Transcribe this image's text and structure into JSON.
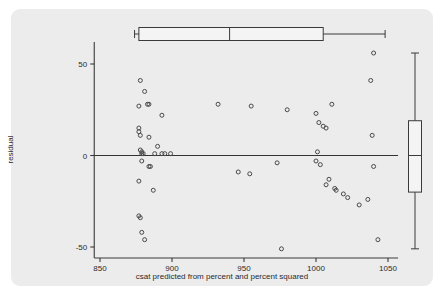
{
  "figure": {
    "background_color": "#ffffff",
    "panel_color": "#ececed",
    "ink_color": "#3a3a3a",
    "marker_color": "#4a4a4a"
  },
  "chart_data": {
    "type": "scatter",
    "title": "",
    "subtitle": "",
    "xlabel": "csat predicted from percent and percent squared",
    "ylabel": "residual",
    "xlim": [
      846,
      1057
    ],
    "ylim": [
      -56,
      62
    ],
    "xticks": [
      850,
      900,
      950,
      1000,
      1050
    ],
    "xticklabels": [
      "850",
      "900",
      "950",
      "1000",
      "1050"
    ],
    "yticks": [
      50,
      0,
      -50
    ],
    "yticklabels": [
      "50",
      "0",
      "-50"
    ],
    "grid": false,
    "legend": null,
    "reference_lines": [
      {
        "orientation": "horizontal",
        "value": 0,
        "label": "zero residual line"
      }
    ],
    "x": [
      878,
      881,
      884,
      877,
      883,
      893,
      877,
      877,
      878,
      884,
      878,
      879,
      879,
      880,
      888,
      890,
      895,
      879,
      884,
      885,
      877,
      887,
      893,
      877,
      878,
      879,
      881,
      932,
      955,
      980,
      1011,
      1000,
      1005,
      1002,
      1007,
      1040,
      1038,
      1039,
      1003,
      973,
      1001,
      1000,
      1009,
      1040,
      946,
      954,
      1013,
      1014,
      1007,
      1019,
      1022,
      1036,
      1030,
      976,
      1043,
      899
    ],
    "y": [
      41,
      35,
      28,
      27,
      28,
      22,
      15,
      13,
      11,
      10,
      3,
      2,
      1,
      1,
      1,
      5,
      1,
      -3,
      -6,
      -6,
      -14,
      -19,
      1,
      -33,
      -34,
      -42,
      -46,
      28,
      27,
      25,
      28,
      23,
      16,
      18,
      15,
      56,
      41,
      11,
      -5,
      -4,
      2,
      -3,
      -13,
      -6,
      -9,
      -10,
      -18,
      -19,
      -16,
      -21,
      -23,
      -24,
      -27,
      -51,
      -46,
      1
    ],
    "marker": {
      "shape": "circle",
      "filled": false,
      "size_px": 4,
      "edge_color": "#4a4a4a"
    },
    "marginal_boxplots": [
      {
        "name": "x-marginal-boxplot",
        "orientation": "horizontal",
        "position": "top",
        "whisker_low": 874,
        "q1": 877,
        "median": 940,
        "q3": 1005,
        "whisker_high": 1048,
        "outliers": []
      },
      {
        "name": "y-marginal-boxplot",
        "orientation": "vertical",
        "position": "right",
        "whisker_low": -51,
        "q1": -20,
        "median": 0,
        "q3": 19,
        "whisker_high": 56,
        "outliers": []
      }
    ]
  }
}
